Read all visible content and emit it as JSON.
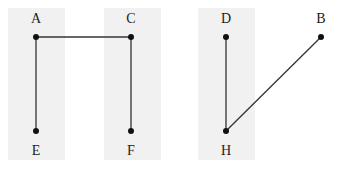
{
  "diagram": {
    "bands": [
      {
        "x": 8,
        "width": 57
      },
      {
        "x": 104,
        "width": 57
      },
      {
        "x": 198,
        "width": 57
      }
    ],
    "band_color": "#f1f1f1",
    "line_color": "#333333",
    "nodes": [
      {
        "id": "A",
        "label": "A",
        "x": 36,
        "y": 37,
        "label_y": 12
      },
      {
        "id": "C",
        "label": "C",
        "x": 131,
        "y": 37,
        "label_y": 12
      },
      {
        "id": "D",
        "label": "D",
        "x": 226,
        "y": 37,
        "label_y": 12
      },
      {
        "id": "B",
        "label": "B",
        "x": 321,
        "y": 37,
        "label_y": 12
      },
      {
        "id": "E",
        "label": "E",
        "x": 36,
        "y": 131,
        "label_y": 144
      },
      {
        "id": "F",
        "label": "F",
        "x": 131,
        "y": 131,
        "label_y": 144
      },
      {
        "id": "H",
        "label": "H",
        "x": 226,
        "y": 131,
        "label_y": 144
      }
    ],
    "edges": [
      {
        "from": "A",
        "to": "C"
      },
      {
        "from": "A",
        "to": "E"
      },
      {
        "from": "C",
        "to": "F"
      },
      {
        "from": "D",
        "to": "H"
      },
      {
        "from": "H",
        "to": "B"
      }
    ]
  }
}
